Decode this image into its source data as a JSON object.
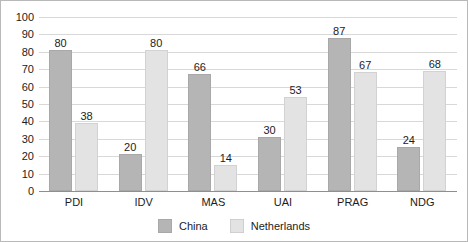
{
  "chart_data": {
    "type": "bar",
    "title": "",
    "subtitle": "",
    "xlabel": "",
    "ylabel": "",
    "ylim": [
      0,
      100
    ],
    "ytick_step": 10,
    "yticks": [
      0,
      10,
      20,
      30,
      40,
      50,
      60,
      70,
      80,
      90,
      100
    ],
    "grid": true,
    "legend_position": "bottom-center",
    "categories": [
      "PDI",
      "IDV",
      "MAS",
      "UAI",
      "PRAG",
      "NDG"
    ],
    "series": [
      {
        "name": "China",
        "color": "#b5b5b5",
        "values": [
          80,
          20,
          66,
          30,
          87,
          24
        ]
      },
      {
        "name": "Netherlands",
        "color": "#e3e3e3",
        "values": [
          38,
          80,
          14,
          53,
          67,
          68
        ]
      }
    ],
    "data_labels": true,
    "annotations": []
  },
  "legend": {
    "items": [
      {
        "label": "China"
      },
      {
        "label": "Netherlands"
      }
    ]
  },
  "colors": {
    "china": "#b5b5b5",
    "netherlands": "#e3e3e3",
    "gridline": "#d8d8d8",
    "axis": "#8f8f8f",
    "frame": "#b9b9b9",
    "text": "#1c1c1c"
  }
}
